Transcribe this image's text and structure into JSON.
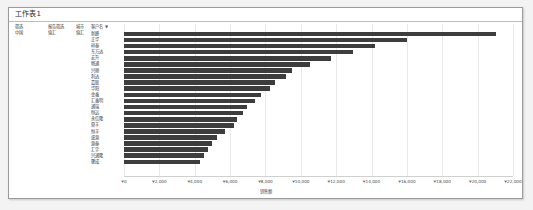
{
  "window": {
    "sheet_title": "工作表1"
  },
  "pivot_filters": [
    {
      "label": "筛选",
      "value": "中国"
    },
    {
      "label": "报告筛选",
      "value": "值汇"
    },
    {
      "label": "城市",
      "value": "值汇"
    }
  ],
  "axis": {
    "category_header": "客户名",
    "category_header_caret": "▼",
    "x_title": "销售额",
    "x_ticks": [
      "¥0",
      "¥2,000",
      "¥4,000",
      "¥6,000",
      "¥8,000",
      "¥10,000",
      "¥12,000",
      "¥14,000",
      "¥16,000",
      "¥18,000",
      "¥20,000",
      "¥22,000"
    ]
  },
  "colors": {
    "bar": "#3d3d3d",
    "grid": "#e9e9e9",
    "frame_border": "#9a9a9a",
    "page_background": "#f3f3f3"
  },
  "chart_data": {
    "type": "bar",
    "orientation": "horizontal",
    "title": "工作表1",
    "xlabel": "销售额",
    "ylabel": "客户名",
    "xlim": [
      0,
      22000
    ],
    "grid": true,
    "legend": "none",
    "categories": [
      "新峰",
      "正华",
      "祥泰",
      "东方达",
      "宏升",
      "畅通",
      "兴顺",
      "利达",
      "嘉联",
      "华阳",
      "金鑫",
      "汇鑫明",
      "通瑞",
      "恒远",
      "永信隆",
      "鼎丰",
      "恒丰",
      "盛源",
      "源泰",
      "汇宇",
      "兴通隆",
      "聚成"
    ],
    "values": [
      21050,
      16000,
      14200,
      12950,
      11700,
      10500,
      9500,
      9150,
      8550,
      8250,
      7750,
      7400,
      6950,
      6750,
      6400,
      6200,
      5700,
      5250,
      4950,
      4750,
      4500,
      4300
    ]
  }
}
